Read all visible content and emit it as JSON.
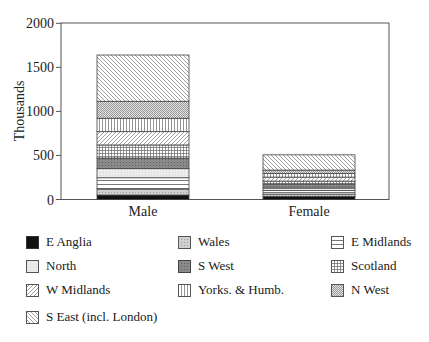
{
  "chart_data": {
    "type": "bar",
    "stacked": true,
    "title": "",
    "xlabel": "",
    "ylabel": "Thousands",
    "ylim": [
      0,
      2000
    ],
    "yticks": [
      0,
      500,
      1000,
      1500,
      2000
    ],
    "grid": false,
    "legend_position": "bottom",
    "categories": [
      "Male",
      "Female"
    ],
    "series": [
      {
        "name": "E Anglia",
        "pattern": "solid-black",
        "values": [
          51,
          34
        ]
      },
      {
        "name": "Wales",
        "pattern": "light-gray-dots",
        "values": [
          68,
          28
        ]
      },
      {
        "name": "E Midlands",
        "pattern": "horizontal-lines",
        "values": [
          128,
          40
        ]
      },
      {
        "name": "North",
        "pattern": "very-light-gray",
        "values": [
          103,
          28
        ]
      },
      {
        "name": "S West",
        "pattern": "dark-gray-dots",
        "values": [
          121,
          45
        ]
      },
      {
        "name": "Scotland",
        "pattern": "grid",
        "values": [
          148,
          34
        ]
      },
      {
        "name": "W Midlands",
        "pattern": "diagonal-forward",
        "values": [
          151,
          45
        ]
      },
      {
        "name": "Yorks. & Humb.",
        "pattern": "vertical-lines",
        "values": [
          152,
          40
        ]
      },
      {
        "name": "N West",
        "pattern": "checker",
        "values": [
          193,
          40
        ]
      },
      {
        "name": "S East (incl. London)",
        "pattern": "diagonal-back",
        "values": [
          525,
          173
        ]
      }
    ],
    "totals": [
      1640,
      507
    ]
  },
  "legend": {
    "items": [
      {
        "label": "E Anglia"
      },
      {
        "label": "Wales"
      },
      {
        "label": "E Midlands"
      },
      {
        "label": "North"
      },
      {
        "label": "S West"
      },
      {
        "label": "Scotland"
      },
      {
        "label": "W Midlands"
      },
      {
        "label": "Yorks. & Humb."
      },
      {
        "label": "N West"
      },
      {
        "label": "S East (incl. London)"
      }
    ]
  }
}
